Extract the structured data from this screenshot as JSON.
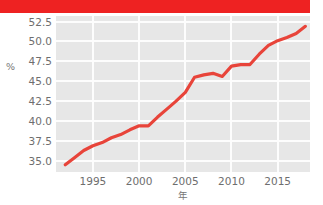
{
  "banner": {
    "color": "#ee2222",
    "text": ""
  },
  "chart_data": {
    "type": "line",
    "title": "",
    "subtitle": "",
    "xlabel": "年",
    "ylabel": "%",
    "grid": true,
    "legend": false,
    "line_color": "#e8443a",
    "plot_background": "#e7e7e7",
    "gridline_color": "#fdfdfd",
    "xlim": [
      1991,
      2018.5
    ],
    "ylim": [
      33.6,
      53.2
    ],
    "xticks": [
      1995,
      2000,
      2005,
      2010,
      2015
    ],
    "xtick_labels": [
      "1995",
      "2000",
      "2005",
      "2010",
      "2015"
    ],
    "yticks": [
      35.0,
      37.5,
      40.0,
      42.5,
      45.0,
      47.5,
      50.0,
      52.5
    ],
    "ytick_labels": [
      "35.0",
      "37.5",
      "40.0",
      "42.5",
      "45.0",
      "47.5",
      "50.0",
      "52.5"
    ],
    "x": [
      1992,
      1993,
      1994,
      1995,
      1996,
      1997,
      1998,
      1999,
      2000,
      2001,
      2002,
      2003,
      2004,
      2005,
      2006,
      2007,
      2008,
      2009,
      2010,
      2011,
      2012,
      2013,
      2014,
      2015,
      2016,
      2017,
      2018
    ],
    "values": [
      34.5,
      35.4,
      36.3,
      36.9,
      37.3,
      37.9,
      38.3,
      38.9,
      39.4,
      39.4,
      40.5,
      41.5,
      42.5,
      43.6,
      45.5,
      45.8,
      46.0,
      45.6,
      46.9,
      47.1,
      47.1,
      48.4,
      49.5,
      50.1,
      50.5,
      51.0,
      51.9
    ],
    "series": [
      {
        "name": "",
        "color": "#e8443a",
        "values": [
          34.5,
          35.4,
          36.3,
          36.9,
          37.3,
          37.9,
          38.3,
          38.9,
          39.4,
          39.4,
          40.5,
          41.5,
          42.5,
          43.6,
          45.5,
          45.8,
          46.0,
          45.6,
          46.9,
          47.1,
          47.1,
          48.4,
          49.5,
          50.1,
          50.5,
          51.0,
          51.9
        ]
      }
    ]
  }
}
